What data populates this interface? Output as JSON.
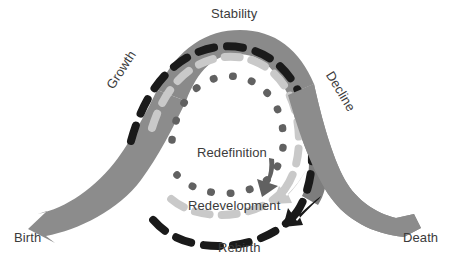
{
  "diagram": {
    "type": "cyclical-spiral",
    "background_color": "#ffffff",
    "text_color": "#3b3b3b",
    "labels": {
      "stability": "Stability",
      "growth": "Growth",
      "decline": "Decline",
      "birth": "Birth",
      "death": "Death",
      "redefinition": "Redefinition",
      "redevelopment": "Redevelopment",
      "rebirth": "Rebirth"
    },
    "colors": {
      "wave_band": "#8c8c8c",
      "outer_arc": "#8a8a8a",
      "rebirth_arc": "#1a1a1a",
      "redevelopment_arc": "#c9c9c9",
      "redefinition_arc": "#616161"
    },
    "arcs": [
      {
        "name": "outer-gray-band",
        "style": "solid",
        "color": "#8a8a8a",
        "label": "Stability",
        "description": "outer continuous gray band forming the wave crest"
      },
      {
        "name": "rebirth-arc",
        "style": "dashed",
        "color": "#1a1a1a",
        "label": "Rebirth",
        "arrow": "down-left",
        "description": "black dashed spiral ending in a solid arrowhead at lower right"
      },
      {
        "name": "redevelopment-arc",
        "style": "dashed",
        "color": "#c9c9c9",
        "label": "Redevelopment",
        "arrow": "down-left",
        "description": "light gray dashed spiral ending in a solid arrowhead"
      },
      {
        "name": "redefinition-arc",
        "style": "dotted",
        "color": "#616161",
        "label": "Redefinition",
        "arrow": "down-right",
        "description": "dark gray dotted innermost spiral ending in a solid arrowhead"
      }
    ],
    "wave": {
      "start_label": "Birth",
      "end_label": "Death",
      "color": "#8c8c8c",
      "description": "broad gray band entering at lower-left from Birth, arcing over the crest, exiting at lower-right to Death"
    }
  }
}
